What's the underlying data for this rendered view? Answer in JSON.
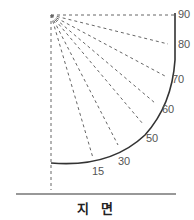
{
  "diagram": {
    "angle_labels": [
      "15",
      "30",
      "50",
      "60",
      "70",
      "80",
      "90"
    ],
    "ground_label": "지 면",
    "colors": {
      "arc": "#333333",
      "dashed": "#555555",
      "text": "#555555",
      "ground": "#333333"
    }
  }
}
